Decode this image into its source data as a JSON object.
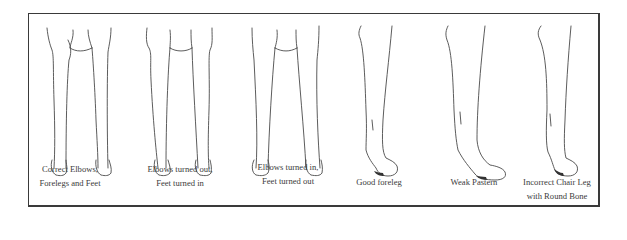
{
  "figure": {
    "panels": [
      {
        "id": "correct-front",
        "caption_lines": [
          "Correct Elbows,",
          "Forelegs and Feet"
        ],
        "view": "front"
      },
      {
        "id": "elbows-out",
        "caption_lines": [
          "Elbows turned out,",
          "Feet turned in"
        ],
        "view": "front"
      },
      {
        "id": "elbows-in",
        "caption_lines": [
          "Elbows turned in,",
          "Feet turned out"
        ],
        "view": "front"
      },
      {
        "id": "good-foreleg",
        "caption_lines": [
          "Good foreleg"
        ],
        "view": "side"
      },
      {
        "id": "weak-pastern",
        "caption_lines": [
          "Weak Pastern"
        ],
        "view": "side"
      },
      {
        "id": "chair-leg",
        "caption_lines": [
          "Incorrect Chair Leg",
          "with Round Bone"
        ],
        "view": "side"
      }
    ],
    "colors": {
      "line": "#4a4a4a",
      "text": "#3b3b3b",
      "frame": "#3a3a3a"
    }
  }
}
